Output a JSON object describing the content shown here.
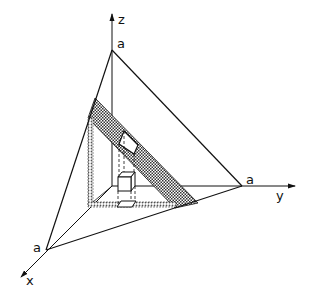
{
  "diagram": {
    "type": "3D coordinate sketch with plane x+y+z=a",
    "axes": {
      "x": {
        "label": "x",
        "intercept_label": "a"
      },
      "y": {
        "label": "y",
        "intercept_label": "a"
      },
      "z": {
        "label": "z",
        "intercept_label": "a"
      }
    },
    "elements": [
      "plane-triangle",
      "shaded-band-on-plane",
      "dotted-projection-band",
      "small-cube",
      "white-patch-on-band",
      "dashed-projection-lines"
    ],
    "colors": {
      "line": "#111111",
      "hatch": "#333333",
      "background": "#ffffff"
    }
  }
}
